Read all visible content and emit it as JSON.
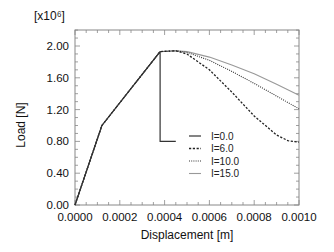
{
  "chart_data": {
    "type": "line",
    "title": "",
    "xlabel": "Displacement [m]",
    "ylabel": "Load [N]",
    "y_multiplier_label": "[x10⁶]",
    "xlim": [
      0,
      0.001
    ],
    "ylim": [
      0,
      2.2
    ],
    "grid": false,
    "legend_position": "center-right inside plot",
    "x_ticks": [
      "0.0000",
      "0.0002",
      "0.0004",
      "0.0006",
      "0.0008",
      "0.0010"
    ],
    "y_ticks": [
      "0.00",
      "0.40",
      "0.80",
      "1.20",
      "1.60",
      "2.00"
    ],
    "series": [
      {
        "name": "I=0.0",
        "style": "solid",
        "color": "#333333",
        "x": [
          0,
          0.00012,
          0.00038,
          0.00038,
          0.00045
        ],
        "y": [
          0,
          1.0,
          1.93,
          0.8,
          0.8
        ]
      },
      {
        "name": "I=6.0",
        "style": "dashed",
        "color": "#222222",
        "x": [
          0,
          0.00012,
          0.00038,
          0.00045,
          0.0005,
          0.0006,
          0.0007,
          0.0008,
          0.0009,
          0.00095,
          0.001
        ],
        "y": [
          0,
          1.0,
          1.93,
          1.94,
          1.9,
          1.7,
          1.42,
          1.12,
          0.88,
          0.81,
          0.79
        ]
      },
      {
        "name": "I=10.0",
        "style": "dotted",
        "color": "#333333",
        "x": [
          0,
          0.00012,
          0.00038,
          0.00045,
          0.0005,
          0.0006,
          0.0007,
          0.0008,
          0.0009,
          0.001
        ],
        "y": [
          0,
          1.0,
          1.93,
          1.94,
          1.92,
          1.82,
          1.68,
          1.53,
          1.37,
          1.21
        ]
      },
      {
        "name": "I=15.0",
        "style": "solid-light",
        "color": "#999999",
        "x": [
          0,
          0.00012,
          0.00038,
          0.00045,
          0.0005,
          0.0006,
          0.0007,
          0.0008,
          0.0009,
          0.001
        ],
        "y": [
          0,
          1.0,
          1.93,
          1.94,
          1.93,
          1.86,
          1.76,
          1.65,
          1.52,
          1.38
        ]
      }
    ]
  }
}
